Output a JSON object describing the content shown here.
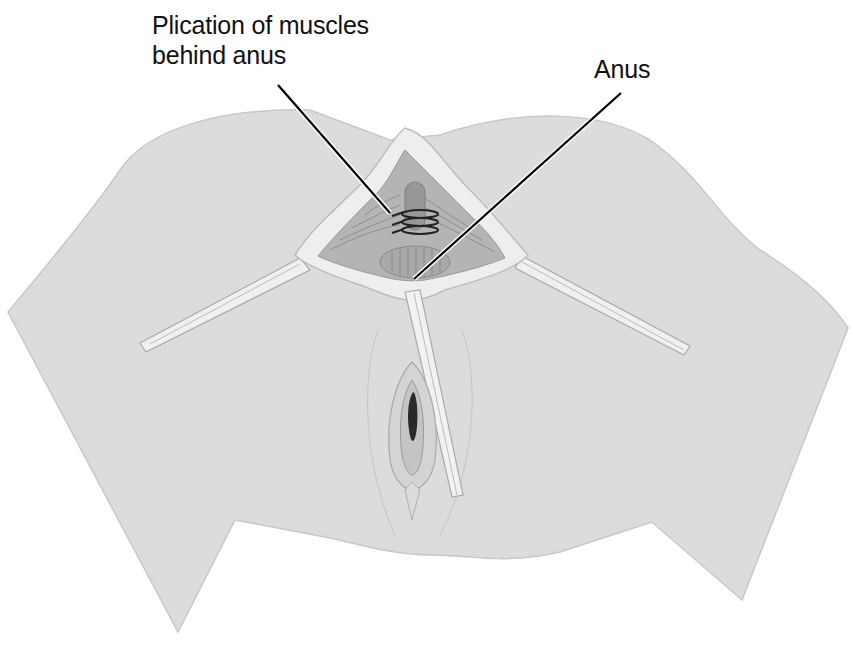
{
  "figure": {
    "type": "surgical illustration",
    "labels": [
      {
        "id": "plication",
        "lines": [
          "Plication of muscles",
          "behind anus"
        ]
      },
      {
        "id": "anus",
        "lines": [
          "Anus"
        ]
      }
    ]
  },
  "colors": {
    "skin": "#dcdcdc",
    "skin_outline": "#c4c4c4",
    "wound_edge": "#eeeeee",
    "muscle": "#a9a9a9",
    "suture": "#222222",
    "leader_line": "#000000"
  }
}
